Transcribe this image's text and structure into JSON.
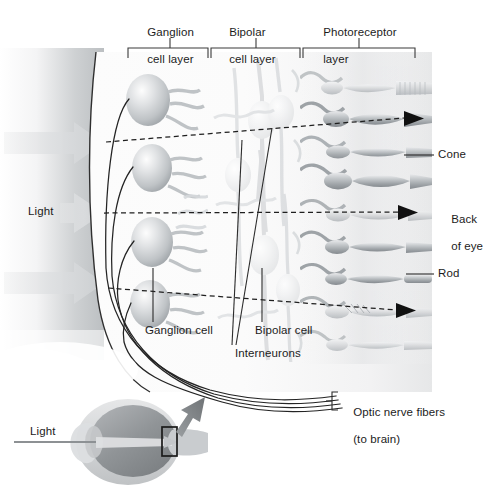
{
  "figure": {
    "type": "anatomical-diagram"
  },
  "top_brackets": [
    {
      "id": "ganglion-cell-layer",
      "label_line1": "Ganglion",
      "label_line2": "cell layer",
      "x_start": 128,
      "x_end": 208,
      "tick_x": 170
    },
    {
      "id": "bipolar-cell-layer",
      "label_line1": "Bipolar",
      "label_line2": "cell layer",
      "x_start": 211,
      "x_end": 300,
      "tick_x": 256
    },
    {
      "id": "photoreceptor-layer",
      "label_line1": "Photoreceptor",
      "label_line2": "layer",
      "x_start": 303,
      "x_end": 415,
      "tick_x": 359
    }
  ],
  "left_labels": {
    "light": "Light"
  },
  "right_labels": [
    {
      "id": "cone",
      "text": "Cone"
    },
    {
      "id": "back-of-eye",
      "line1": "Back",
      "line2": "of eye"
    },
    {
      "id": "rod",
      "text": "Rod"
    }
  ],
  "bottom_labels": [
    {
      "id": "ganglion-cell",
      "text": "Ganglion cell"
    },
    {
      "id": "interneurons",
      "text": "Interneurons"
    },
    {
      "id": "bipolar-cell",
      "text": "Bipolar cell"
    }
  ],
  "optic_nerve": {
    "line1": "Optic nerve fibers",
    "line2": "(to brain)"
  },
  "inset_eye": {
    "light_label": "Light"
  },
  "colors": {
    "text": "#1c1c1c",
    "leader_line": "#3a3a3a",
    "bracket": "#3a3a3a",
    "cell_mid": "#b9bcc0",
    "cell_dark": "#8f9499",
    "cell_light": "#e3e5e7",
    "light_arrow": "#d5d7d9",
    "retina_edge": "#2b2b2b",
    "eye_sclera": "#d2d4d6",
    "eye_vitreous": "#8e9194",
    "inset_arrow": "#7d8184"
  }
}
